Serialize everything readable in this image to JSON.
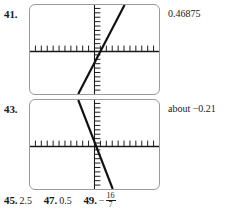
{
  "page": {
    "kind": "textbook-answer-key-excerpt"
  },
  "exercises": [
    {
      "number": "41.",
      "answer": "0.46875",
      "graph": {
        "type": "line",
        "caption": "graphing-calculator screen showing a line with positive slope crossing near the origin",
        "xlabel": "",
        "ylabel": "",
        "xlim": [
          -10,
          10
        ],
        "ylim": [
          -10,
          10
        ],
        "grid": false,
        "x_axis_ticks": 20,
        "y_axis_ticks": 20,
        "series": [
          {
            "name": "line-41",
            "slope_sign": "positive",
            "x": [
              -4.0,
              4.6
            ],
            "y": [
              -10.0,
              10.0
            ]
          }
        ]
      }
    },
    {
      "number": "43.",
      "answer": "about −0.21",
      "graph": {
        "type": "line",
        "caption": "graphing-calculator screen showing a line with steep negative slope crossing near the origin",
        "xlabel": "",
        "ylabel": "",
        "xlim": [
          -10,
          10
        ],
        "ylim": [
          -10,
          10
        ],
        "grid": false,
        "x_axis_ticks": 20,
        "y_axis_ticks": 20,
        "series": [
          {
            "name": "line-43",
            "slope_sign": "negative",
            "x": [
              -4.0,
              2.4
            ],
            "y": [
              10.0,
              -10.0
            ]
          }
        ]
      }
    }
  ],
  "bottom_answers": [
    {
      "number": "45.",
      "value": "2.5",
      "fraction": null
    },
    {
      "number": "47.",
      "value": "0.5",
      "fraction": null
    },
    {
      "number": "49.",
      "value": "−",
      "fraction": {
        "numerator": "16",
        "denominator": "7"
      }
    }
  ],
  "colors": {
    "ink": "#1a1a1a",
    "screen_border": "#9a9a9a",
    "axis": "#1a1a1a",
    "curve": "#111111",
    "background": "#ffffff"
  }
}
